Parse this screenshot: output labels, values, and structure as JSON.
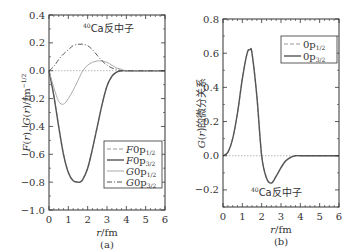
{
  "chart_data": [
    {
      "panel": "(a)",
      "type": "line",
      "title": "",
      "annotation": "⁴⁰Ca反中子",
      "xlabel": "r/fm",
      "ylabel": "F(r), G(r)/fm^-1/2",
      "xlim": [
        0,
        6
      ],
      "ylim": [
        -1.0,
        0.4
      ],
      "xticks": [
        "0",
        "1",
        "2",
        "3",
        "4",
        "5",
        "6"
      ],
      "yticks": [
        "0.4",
        "0.2",
        "0.0",
        "−0.2",
        "−0.4",
        "−0.6",
        "−0.8",
        "−1.0"
      ],
      "legend_position": "lower right",
      "x": [
        0,
        0.25,
        0.5,
        0.75,
        1.0,
        1.25,
        1.5,
        1.6,
        1.75,
        2.0,
        2.25,
        2.5,
        2.75,
        3.0,
        3.25,
        3.5,
        3.75,
        4.0,
        4.5,
        5.0,
        6.0
      ],
      "series": [
        {
          "name": "F0p1/2",
          "style": "dashed light",
          "values": [
            0,
            -0.18,
            -0.4,
            -0.6,
            -0.73,
            -0.79,
            -0.8,
            -0.8,
            -0.78,
            -0.7,
            -0.56,
            -0.4,
            -0.24,
            -0.11,
            -0.04,
            -0.01,
            0,
            0,
            0,
            0,
            0
          ]
        },
        {
          "name": "F0p3/2",
          "style": "solid dark",
          "values": [
            0,
            -0.18,
            -0.4,
            -0.6,
            -0.73,
            -0.79,
            -0.8,
            -0.8,
            -0.78,
            -0.7,
            -0.56,
            -0.4,
            -0.24,
            -0.11,
            -0.04,
            -0.01,
            0,
            0,
            0,
            0,
            0
          ]
        },
        {
          "name": "G0p1/2",
          "style": "solid light",
          "values": [
            0,
            -0.12,
            -0.22,
            -0.24,
            -0.2,
            -0.14,
            -0.07,
            -0.04,
            0.0,
            0.04,
            0.06,
            0.07,
            0.07,
            0.06,
            0.04,
            0.02,
            0.01,
            0,
            0,
            0,
            0
          ]
        },
        {
          "name": "G0p3/2",
          "style": "dash-dot",
          "values": [
            0,
            0.03,
            0.08,
            0.12,
            0.15,
            0.18,
            0.19,
            0.19,
            0.19,
            0.18,
            0.15,
            0.11,
            0.07,
            0.04,
            0.02,
            0.01,
            0,
            0,
            0,
            0,
            0
          ]
        }
      ]
    },
    {
      "panel": "(b)",
      "type": "line",
      "title": "",
      "annotation": "⁴⁰Ca反中子",
      "xlabel": "r/fm",
      "ylabel": "G(r)的微分关系",
      "xlim": [
        0,
        6
      ],
      "ylim": [
        -0.3,
        0.8
      ],
      "xticks": [
        "0",
        "1",
        "2",
        "3",
        "4",
        "5",
        "6"
      ],
      "yticks": [
        "0.8",
        "0.6",
        "0.4",
        "0.2",
        "0.0",
        "−0.2"
      ],
      "legend_position": "upper right",
      "x": [
        0,
        0.25,
        0.5,
        0.75,
        1.0,
        1.25,
        1.4,
        1.5,
        1.75,
        2.0,
        2.25,
        2.5,
        2.75,
        3.0,
        3.25,
        3.5,
        3.75,
        4.0,
        5.0,
        6.0
      ],
      "series": [
        {
          "name": "0p1/2",
          "style": "dashed light",
          "values": [
            0,
            0.02,
            0.1,
            0.25,
            0.45,
            0.6,
            0.62,
            0.6,
            0.35,
            0.0,
            -0.13,
            -0.16,
            -0.12,
            -0.07,
            -0.03,
            -0.01,
            0,
            0,
            0,
            0
          ]
        },
        {
          "name": "0p3/2",
          "style": "solid dark",
          "values": [
            0,
            0.02,
            0.1,
            0.25,
            0.45,
            0.6,
            0.62,
            0.6,
            0.35,
            0.0,
            -0.13,
            -0.16,
            -0.12,
            -0.07,
            -0.03,
            -0.01,
            0,
            0,
            0,
            0
          ]
        }
      ]
    }
  ],
  "panels": {
    "a": {
      "label": "(a)",
      "xlabel": "r/fm",
      "ylabel": "F(r), G(r)/fm⁻¹ᐟ²",
      "annotation_sup": "40",
      "annotation": "Ca反中子",
      "legend": [
        "F0p1/2",
        "F0p3/2",
        "G0p1/2",
        "G0p3/2"
      ]
    },
    "b": {
      "label": "(b)",
      "xlabel": "r/fm",
      "ylabel": "G(r)的微分关系",
      "annotation_sup": "40",
      "annotation": "Ca反中子",
      "legend": [
        "0p1/2",
        "0p3/2"
      ]
    }
  }
}
